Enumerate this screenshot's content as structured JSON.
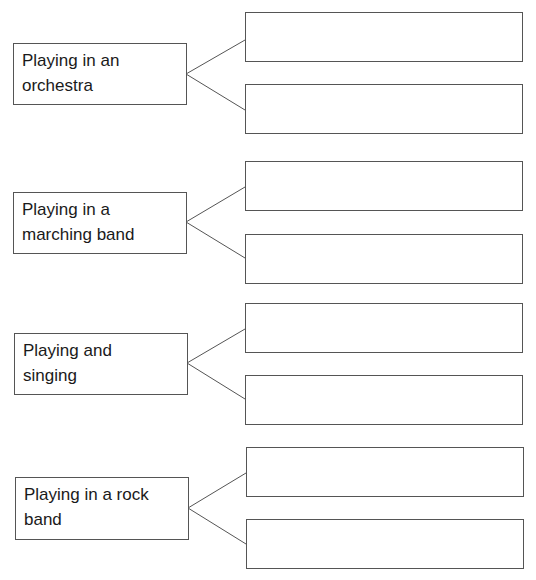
{
  "diagram": {
    "type": "branching-worksheet",
    "groups": [
      {
        "label_lines": [
          "Playing in an",
          "orchestra"
        ],
        "answers": [
          "",
          ""
        ]
      },
      {
        "label_lines": [
          "Playing in a",
          "marching band"
        ],
        "answers": [
          "",
          ""
        ]
      },
      {
        "label_lines": [
          "Playing and",
          "singing"
        ],
        "answers": [
          "",
          ""
        ]
      },
      {
        "label_lines": [
          "Playing in a rock",
          "band"
        ],
        "answers": [
          "",
          ""
        ]
      }
    ],
    "colors": {
      "border": "#555555",
      "text": "#1a1a1a",
      "background": "#ffffff"
    }
  }
}
